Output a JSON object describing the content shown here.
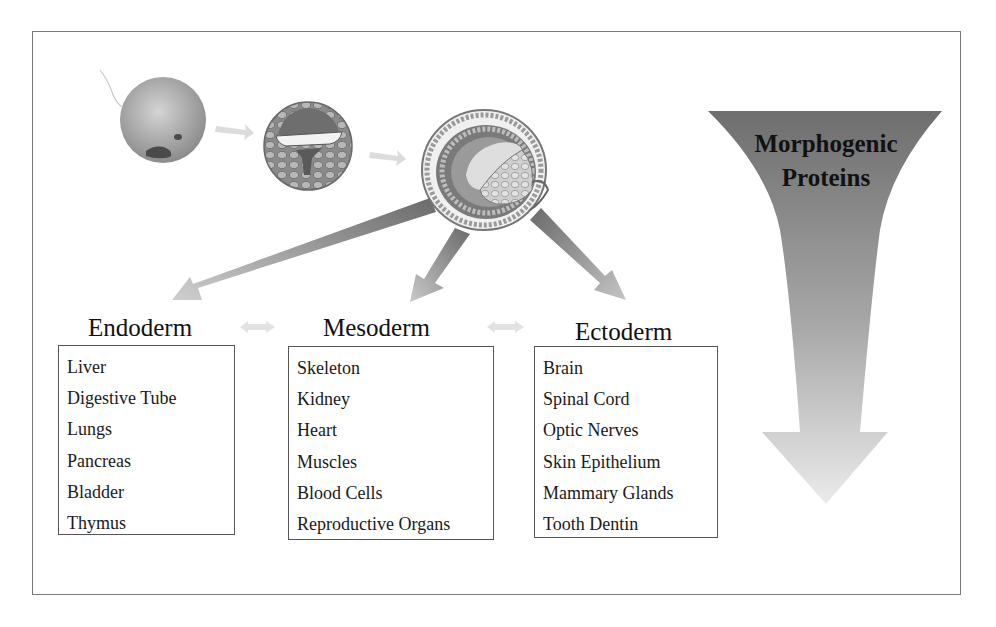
{
  "diagram": {
    "stages": [
      {
        "name": "zygote",
        "icon": "fertilized-egg-icon"
      },
      {
        "name": "blastula",
        "icon": "blastula-icon"
      },
      {
        "name": "gastrula",
        "icon": "gastrula-icon"
      }
    ],
    "germ_layers": [
      {
        "title": "Endoderm",
        "items": [
          "Liver",
          "Digestive Tube",
          "Lungs",
          "Pancreas",
          "Bladder",
          "Thymus"
        ]
      },
      {
        "title": "Mesoderm",
        "items": [
          "Skeleton",
          "Kidney",
          "Heart",
          "Muscles",
          "Blood Cells",
          "Reproductive Organs"
        ]
      },
      {
        "title": "Ectoderm",
        "items": [
          "Brain",
          "Spinal Cord",
          "Optic Nerves",
          "Skin Epithelium",
          "Mammary Glands",
          "Tooth Dentin"
        ]
      }
    ],
    "gradient_arrow": {
      "label_line1": "Morphogenic",
      "label_line2": "Proteins",
      "color_top": "#6e6e6e",
      "color_bottom": "#e6e6e6"
    },
    "colors": {
      "frame_border": "#7a7a7a",
      "box_border": "#555555",
      "arrow_dark": "#707070",
      "arrow_light": "#d0d0d0"
    }
  }
}
